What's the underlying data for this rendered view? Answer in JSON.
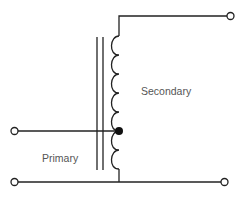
{
  "diagram": {
    "type": "autotransformer schematic",
    "labels": {
      "secondary": "Secondary",
      "primary": "Primary"
    },
    "components": {
      "core": "iron-core (two parallel lines)",
      "winding": "single tapped coil",
      "tap": "center tap connection dot",
      "terminals": [
        "primary-input",
        "common-bottom-left",
        "secondary-output-top",
        "secondary-output-bottom"
      ]
    },
    "colors": {
      "line": "#222222",
      "label": "#555555",
      "background": "#ffffff"
    }
  }
}
